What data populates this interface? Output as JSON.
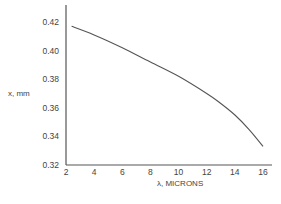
{
  "chart_data": {
    "type": "line",
    "title": "",
    "xlabel": "λ, MICRONS",
    "ylabel": "x, mm",
    "xlim": [
      2,
      16.6
    ],
    "ylim": [
      0.32,
      0.42
    ],
    "xticks": [
      2,
      4,
      6,
      8,
      10,
      12,
      14,
      16
    ],
    "xtick_labels": [
      "2",
      "4",
      "6",
      "8",
      "10",
      "12",
      "14",
      "16"
    ],
    "yticks": [
      0.32,
      0.34,
      0.36,
      0.38,
      0.4,
      0.42
    ],
    "ytick_labels": [
      "0.32",
      "0.34",
      "0.36",
      "0.38",
      "0.40",
      "0.42"
    ],
    "grid": false,
    "legend": null,
    "series": [
      {
        "name": "x vs λ",
        "x": [
          2.4,
          4,
          6,
          8,
          10,
          12,
          13,
          14,
          15,
          16
        ],
        "y": [
          0.417,
          0.411,
          0.402,
          0.392,
          0.382,
          0.37,
          0.363,
          0.355,
          0.345,
          0.333
        ]
      }
    ]
  },
  "colors": {
    "line": "#555555",
    "axis": "#555555",
    "text": "#444444"
  }
}
